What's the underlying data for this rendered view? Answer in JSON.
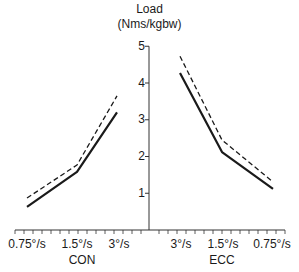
{
  "chart_data": {
    "type": "line",
    "title": "Load",
    "ylabel": "Load (Nms/kgbw)",
    "ylabel_line1": "Load",
    "ylabel_line2": "(Nms/kgbw)",
    "xlabel": "",
    "ylim": [
      0,
      5
    ],
    "yticks": [
      "1",
      "2",
      "3",
      "4",
      "5"
    ],
    "grid": false,
    "legend": "none",
    "groups": [
      {
        "name": "CON",
        "categories": [
          "0.75°/s",
          "1.5°/s",
          "3°/s"
        ],
        "series": [
          {
            "name": "solid",
            "style": "solid",
            "values": [
              0.63,
              1.58,
              3.2
            ]
          },
          {
            "name": "dashed",
            "style": "dashed",
            "values": [
              0.87,
              1.77,
              3.65
            ]
          }
        ]
      },
      {
        "name": "ECC",
        "categories": [
          "3°/s",
          "1.5°/s",
          "0.75°/s"
        ],
        "series": [
          {
            "name": "solid",
            "style": "solid",
            "values": [
              4.27,
              2.12,
              1.12
            ]
          },
          {
            "name": "dashed",
            "style": "dashed",
            "values": [
              4.73,
              2.45,
              1.31
            ]
          }
        ]
      }
    ]
  },
  "colors": {
    "line": "#1a1a1a",
    "axis": "#333333"
  }
}
